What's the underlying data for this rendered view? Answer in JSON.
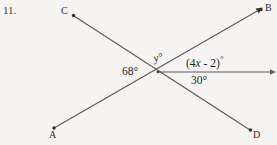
{
  "problem": {
    "number": "11."
  },
  "diagram": {
    "type": "geometry-intersecting-lines",
    "background_color": "#f6f4f3",
    "line_color": "#5a5a5a",
    "text_color": "#1f1f1f",
    "intersection": {
      "x": 158,
      "y": 72
    },
    "points": [
      {
        "id": "C",
        "label": "C",
        "x": 72,
        "y": 15,
        "marker": "dot"
      },
      {
        "id": "B",
        "label": "B",
        "x": 262,
        "y": 9,
        "marker": "dot-arrow"
      },
      {
        "id": "A",
        "label": "A",
        "x": 52,
        "y": 129,
        "marker": "dot"
      },
      {
        "id": "D",
        "label": "D",
        "x": 252,
        "y": 130,
        "marker": "dot"
      }
    ],
    "lines": [
      {
        "id": "line-CD",
        "from": "C",
        "to": "D",
        "through": "intersection"
      },
      {
        "id": "line-AB",
        "from": "A",
        "to": "B",
        "through": "intersection"
      },
      {
        "id": "ray-east",
        "from": "intersection",
        "to": "right-edge",
        "arrow": true
      }
    ],
    "angles": [
      {
        "id": "angle-68",
        "label": "68",
        "unit": "°",
        "text": "68°",
        "position": "left-of-intersection"
      },
      {
        "id": "angle-y",
        "label": "y",
        "unit": "°",
        "text": "y°",
        "italic": true,
        "position": "above-intersection"
      },
      {
        "id": "angle-4x-2",
        "label": "(4x - 2)",
        "unit": "°",
        "text": "(4x - 2)°",
        "expression_prefix": "(4",
        "expression_var": "x",
        "expression_suffix": " - 2)",
        "position": "upper-right-of-intersection"
      },
      {
        "id": "angle-30",
        "label": "30",
        "unit": "°",
        "text": "30°",
        "position": "lower-right-of-intersection"
      }
    ]
  }
}
